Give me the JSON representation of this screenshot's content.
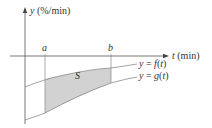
{
  "diagram": {
    "y_axis_label": "y (%/min)",
    "t_axis_label": "t (min)",
    "tick_a": "a",
    "tick_b": "b",
    "region_label": "S",
    "curve_f_label": "y = f(t)",
    "curve_g_label": "y = g(t)",
    "colors": {
      "axis": "#555555",
      "curve": "#8a8a8a",
      "shade": "#d2d2d2",
      "text": "#333333"
    }
  }
}
